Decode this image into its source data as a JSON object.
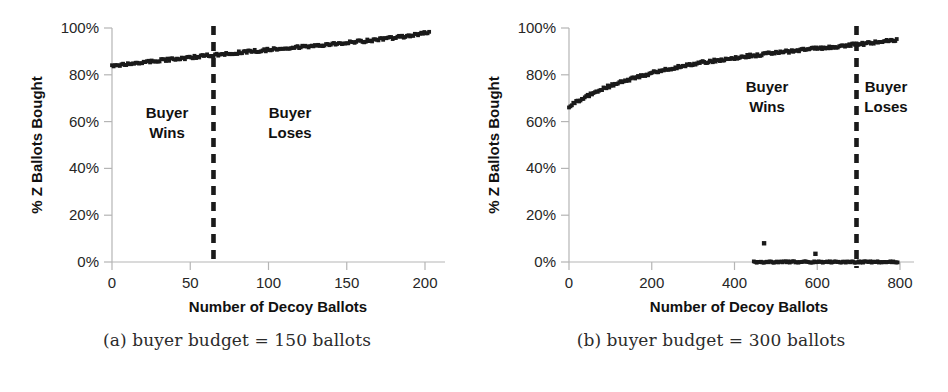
{
  "figure": {
    "panels": [
      {
        "id": "panel-a",
        "caption": "(a) buyer budget = 150 ballots",
        "chart_data": {
          "type": "scatter",
          "title": "",
          "xlabel": "Number of Decoy Ballots",
          "ylabel": "% Z Ballots Bought",
          "xlim": [
            0,
            210
          ],
          "ylim": [
            0,
            1.0
          ],
          "xticks": [
            0,
            50,
            100,
            150,
            200
          ],
          "xtick_labels": [
            "0",
            "50",
            "100",
            "150",
            "200"
          ],
          "yticks": [
            0,
            0.2,
            0.4,
            0.6,
            0.8,
            1.0
          ],
          "ytick_labels": [
            "0%",
            "20%",
            "40%",
            "60%",
            "80%",
            "100%"
          ],
          "grid": false,
          "legend": "none",
          "marker_color": "#1a1a1a",
          "series": [
            {
              "name": "% Z Ballots Bought",
              "x": [
                0,
                5,
                10,
                15,
                20,
                25,
                30,
                35,
                40,
                45,
                50,
                55,
                60,
                65,
                70,
                75,
                80,
                85,
                90,
                95,
                100,
                105,
                110,
                115,
                120,
                125,
                130,
                135,
                140,
                145,
                150,
                155,
                160,
                165,
                170,
                175,
                180,
                185,
                190,
                195,
                200
              ],
              "values": [
                0.837,
                0.841,
                0.845,
                0.849,
                0.853,
                0.857,
                0.861,
                0.864,
                0.868,
                0.871,
                0.875,
                0.878,
                0.882,
                0.885,
                0.888,
                0.892,
                0.895,
                0.898,
                0.901,
                0.904,
                0.908,
                0.911,
                0.914,
                0.917,
                0.92,
                0.923,
                0.926,
                0.929,
                0.932,
                0.935,
                0.938,
                0.941,
                0.945,
                0.948,
                0.952,
                0.956,
                0.96,
                0.965,
                0.97,
                0.975,
                0.982
              ]
            }
          ],
          "annotations": [
            {
              "name": "threshold-line",
              "type": "vline",
              "x": 64,
              "style": "dashed",
              "color": "#1a1a1a"
            },
            {
              "name": "buyer-wins-label",
              "type": "text",
              "text": "Buyer\nWins",
              "x": 27,
              "y": 0.56
            },
            {
              "name": "buyer-loses-label",
              "type": "text",
              "text": "Buyer\nLoses",
              "x": 110,
              "y": 0.56
            }
          ],
          "region_labels": {
            "left_line1": "Buyer",
            "left_line2": "Wins",
            "right_line1": "Buyer",
            "right_line2": "Loses"
          }
        }
      },
      {
        "id": "panel-b",
        "caption": "(b) buyer budget = 300 ballots",
        "chart_data": {
          "type": "scatter",
          "title": "",
          "xlabel": "Number of Decoy Ballots",
          "ylabel": "% Z Ballots Bought",
          "xlim": [
            0,
            840
          ],
          "ylim": [
            0,
            1.0
          ],
          "xticks": [
            0,
            200,
            400,
            600,
            800
          ],
          "xtick_labels": [
            "0",
            "200",
            "400",
            "600",
            "800"
          ],
          "yticks": [
            0,
            0.2,
            0.4,
            0.6,
            0.8,
            1.0
          ],
          "ytick_labels": [
            "0%",
            "20%",
            "40%",
            "60%",
            "80%",
            "100%"
          ],
          "grid": false,
          "legend": "none",
          "marker_color": "#1a1a1a",
          "series": [
            {
              "name": "% Z Ballots Bought (upper branch)",
              "x": [
                0,
                20,
                40,
                60,
                80,
                100,
                120,
                140,
                160,
                180,
                200,
                220,
                240,
                260,
                280,
                300,
                320,
                340,
                360,
                380,
                400,
                420,
                440,
                460,
                480,
                500,
                520,
                540,
                560,
                580,
                600,
                620,
                640,
                660,
                680,
                700,
                720,
                740,
                760,
                780,
                800
              ],
              "values": [
                0.663,
                0.686,
                0.706,
                0.723,
                0.739,
                0.753,
                0.766,
                0.777,
                0.788,
                0.798,
                0.807,
                0.816,
                0.824,
                0.831,
                0.838,
                0.845,
                0.851,
                0.857,
                0.862,
                0.867,
                0.872,
                0.877,
                0.881,
                0.885,
                0.889,
                0.893,
                0.897,
                0.901,
                0.905,
                0.908,
                0.912,
                0.915,
                0.919,
                0.922,
                0.926,
                0.929,
                0.933,
                0.937,
                0.941,
                0.946,
                0.952
              ]
            },
            {
              "name": "% Z Ballots Bought (zero branch)",
              "x": [
                450,
                460,
                470,
                480,
                490,
                500,
                510,
                520,
                530,
                540,
                550,
                560,
                570,
                580,
                590,
                600,
                610,
                620,
                630,
                640,
                650,
                660,
                670,
                680,
                690,
                700,
                710,
                720,
                730,
                740,
                750,
                760,
                770,
                780,
                790,
                800
              ],
              "values": [
                0.0,
                0.0,
                0.0,
                0.0,
                0.0,
                0.0,
                0.0,
                0.0,
                0.0,
                0.0,
                0.0,
                0.0,
                0.0,
                0.0,
                0.0,
                0.0,
                0.0,
                0.0,
                0.0,
                0.0,
                0.0,
                0.0,
                0.0,
                0.0,
                0.0,
                0.0,
                0.0,
                0.0,
                0.0,
                0.0,
                0.0,
                0.0,
                0.0,
                0.0,
                0.0,
                0.0
              ]
            },
            {
              "name": "outliers",
              "x": [
                475,
                600
              ],
              "values": [
                0.08,
                0.035
              ]
            }
          ],
          "annotations": [
            {
              "name": "threshold-line",
              "type": "vline",
              "x": 700,
              "style": "dashed",
              "color": "#1a1a1a"
            },
            {
              "name": "buyer-wins-label",
              "type": "text",
              "text": "Buyer\nWins",
              "x": 480,
              "y": 0.74
            },
            {
              "name": "buyer-loses-label",
              "type": "text",
              "text": "Buyer\nLoses",
              "x": 775,
              "y": 0.74
            }
          ],
          "region_labels": {
            "left_line1": "Buyer",
            "left_line2": "Wins",
            "right_line1": "Buyer",
            "right_line2": "Loses"
          }
        }
      }
    ]
  }
}
